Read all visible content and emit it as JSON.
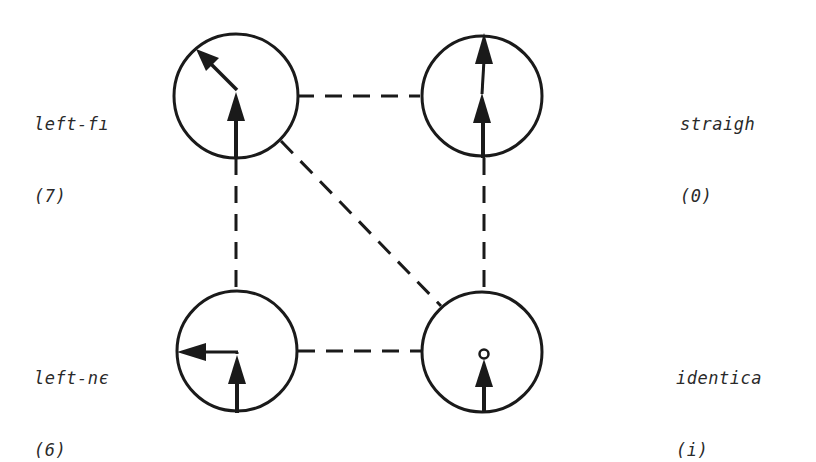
{
  "diagram": {
    "type": "state-transition-graph",
    "colors": {
      "background": "#ffffff",
      "stroke": "#1a1a1a",
      "text": "#2a2a2a"
    },
    "nodes": [
      {
        "id": "left-far",
        "label": "left-fı",
        "code": "(7)",
        "position": "top-left",
        "icon": "arrow-up-then-up-left-icon"
      },
      {
        "id": "straight",
        "label": "straigh",
        "code": "(0)",
        "position": "top-right",
        "icon": "arrow-up-then-up-icon"
      },
      {
        "id": "left-near",
        "label": "left-nє",
        "code": "(6)",
        "position": "bottom-left",
        "icon": "arrow-up-then-left-icon"
      },
      {
        "id": "identical",
        "label": "identica",
        "code": "(i)",
        "position": "bottom-right",
        "icon": "arrow-up-stop-icon"
      }
    ],
    "edges": [
      {
        "from": "left-far",
        "to": "straight",
        "style": "dashed"
      },
      {
        "from": "left-far",
        "to": "left-near",
        "style": "dashed"
      },
      {
        "from": "left-far",
        "to": "identical",
        "style": "dashed"
      },
      {
        "from": "straight",
        "to": "identical",
        "style": "dashed"
      },
      {
        "from": "left-near",
        "to": "identical",
        "style": "dashed"
      }
    ]
  }
}
